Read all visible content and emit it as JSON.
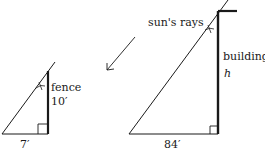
{
  "diagram": {
    "type": "similar-triangles-shadow-problem",
    "sun_label": "sun's rays",
    "small_triangle": {
      "object_label": "fence",
      "height_label": "10′",
      "base_label": "7′"
    },
    "large_triangle": {
      "object_label": "building",
      "height_label": "h",
      "base_label": "84′"
    },
    "colors": {
      "line": "#1a1a1a",
      "background": "#ffffff"
    }
  }
}
